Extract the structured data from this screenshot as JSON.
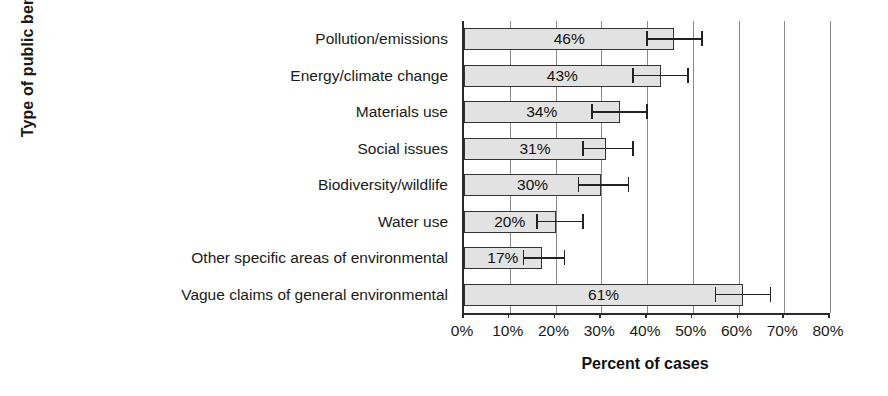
{
  "chart_data": {
    "type": "bar",
    "orientation": "horizontal",
    "title": "",
    "xlabel": "Percent of cases",
    "ylabel": "Type of public benefit",
    "xlim": [
      0,
      80
    ],
    "xticks": [
      0,
      10,
      20,
      30,
      40,
      50,
      60,
      70,
      80
    ],
    "xtick_labels": [
      "0%",
      "10%",
      "20%",
      "30%",
      "40%",
      "50%",
      "60%",
      "70%",
      "80%"
    ],
    "grid": true,
    "grid_axis": "x",
    "legend": "none",
    "bar_fill_color": "#e2e2e2",
    "bar_edge_color": "#333333",
    "error_bar_color": "#222222",
    "categories": [
      "Pollution/emissions",
      "Energy/climate change",
      "Materials use",
      "Social issues",
      "Biodiversity/wildlife",
      "Water use",
      "Other specific areas of environmental",
      "Vague claims of general environmental"
    ],
    "values": [
      46,
      43,
      34,
      31,
      30,
      20,
      17,
      61
    ],
    "value_labels": [
      "46%",
      "43%",
      "34%",
      "31%",
      "30%",
      "20%",
      "17%",
      "61%"
    ],
    "error_bars": [
      {
        "low": 40,
        "high": 52
      },
      {
        "low": 37,
        "high": 49
      },
      {
        "low": 28,
        "high": 40
      },
      {
        "low": 26,
        "high": 37
      },
      {
        "low": 25,
        "high": 36
      },
      {
        "low": 16,
        "high": 26
      },
      {
        "low": 13,
        "high": 22
      },
      {
        "low": 55,
        "high": 67
      }
    ]
  },
  "axes": {
    "y_title": "Type of public benefit",
    "x_title": "Percent of cases"
  }
}
